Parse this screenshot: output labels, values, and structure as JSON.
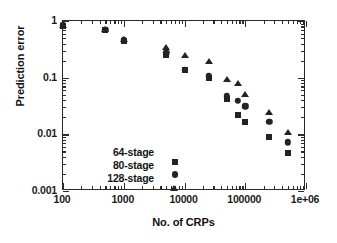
{
  "chart_data": {
    "type": "scatter",
    "title": "",
    "xlabel": "No. of CRPs",
    "ylabel": "Prediction error",
    "xscale": "log",
    "yscale": "log",
    "xlim": [
      100,
      1000000
    ],
    "ylim": [
      0.001,
      1
    ],
    "grid": false,
    "legend_position": "lower left",
    "xticklabels": [
      "100",
      "1000",
      "10000",
      "100000",
      "1e+06"
    ],
    "xtickvalues": [
      100,
      1000,
      10000,
      100000,
      1000000
    ],
    "yticklabels": [
      "1",
      "0.1",
      "0.01",
      "0.001"
    ],
    "ytickvalues": [
      1,
      0.1,
      0.01,
      0.001
    ],
    "series": [
      {
        "name": "64-stage",
        "marker": "square",
        "color": "#232323",
        "points": [
          {
            "x": 100,
            "y": 0.82
          },
          {
            "x": 500,
            "y": 0.69
          },
          {
            "x": 1000,
            "y": 0.45
          },
          {
            "x": 5000,
            "y": 0.255
          },
          {
            "x": 10000,
            "y": 0.135
          },
          {
            "x": 25000,
            "y": 0.1
          },
          {
            "x": 50000,
            "y": 0.042
          },
          {
            "x": 75000,
            "y": 0.022
          },
          {
            "x": 100000,
            "y": 0.0165
          },
          {
            "x": 250000,
            "y": 0.0091
          },
          {
            "x": 500000,
            "y": 0.0046
          }
        ]
      },
      {
        "name": "80-stage",
        "marker": "circle",
        "color": "#232323",
        "points": [
          {
            "x": 100,
            "y": 0.84
          },
          {
            "x": 500,
            "y": 0.7
          },
          {
            "x": 1000,
            "y": 0.46
          },
          {
            "x": 5000,
            "y": 0.275
          },
          {
            "x": 10000,
            "y": 0.137
          },
          {
            "x": 25000,
            "y": 0.105
          },
          {
            "x": 50000,
            "y": 0.047
          },
          {
            "x": 75000,
            "y": 0.039
          },
          {
            "x": 100000,
            "y": 0.031
          },
          {
            "x": 250000,
            "y": 0.0165
          },
          {
            "x": 500000,
            "y": 0.0072
          }
        ]
      },
      {
        "name": "128-stage",
        "marker": "triangle",
        "color": "#232323",
        "points": [
          {
            "x": 100,
            "y": 0.86
          },
          {
            "x": 500,
            "y": 0.72
          },
          {
            "x": 1000,
            "y": 0.48
          },
          {
            "x": 5000,
            "y": 0.35
          },
          {
            "x": 10000,
            "y": 0.25
          },
          {
            "x": 25000,
            "y": 0.195
          },
          {
            "x": 50000,
            "y": 0.094
          },
          {
            "x": 75000,
            "y": 0.079
          },
          {
            "x": 100000,
            "y": 0.051
          },
          {
            "x": 250000,
            "y": 0.025
          },
          {
            "x": 500000,
            "y": 0.0112
          }
        ]
      }
    ]
  },
  "legend": {
    "items": [
      {
        "label": "64-stage",
        "marker": "square"
      },
      {
        "label": "80-stage",
        "marker": "circle"
      },
      {
        "label": "128-stage",
        "marker": "triangle"
      }
    ]
  }
}
